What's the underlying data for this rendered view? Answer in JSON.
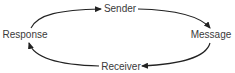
{
  "diagram": {
    "type": "cycle",
    "direction": "clockwise",
    "nodes": [
      {
        "id": "sender",
        "label": "Sender",
        "x": 120,
        "y": 9
      },
      {
        "id": "message",
        "label": "Message",
        "x": 211,
        "y": 35
      },
      {
        "id": "receiver",
        "label": "Receiver",
        "x": 121,
        "y": 67
      },
      {
        "id": "response",
        "label": "Response",
        "x": 25,
        "y": 35
      }
    ],
    "edges": [
      {
        "from": "response",
        "to": "sender"
      },
      {
        "from": "sender",
        "to": "message"
      },
      {
        "from": "message",
        "to": "receiver"
      },
      {
        "from": "receiver",
        "to": "response"
      }
    ],
    "colors": {
      "stroke": "#222222",
      "text": "#3a3a3a",
      "background": "#ffffff"
    }
  }
}
